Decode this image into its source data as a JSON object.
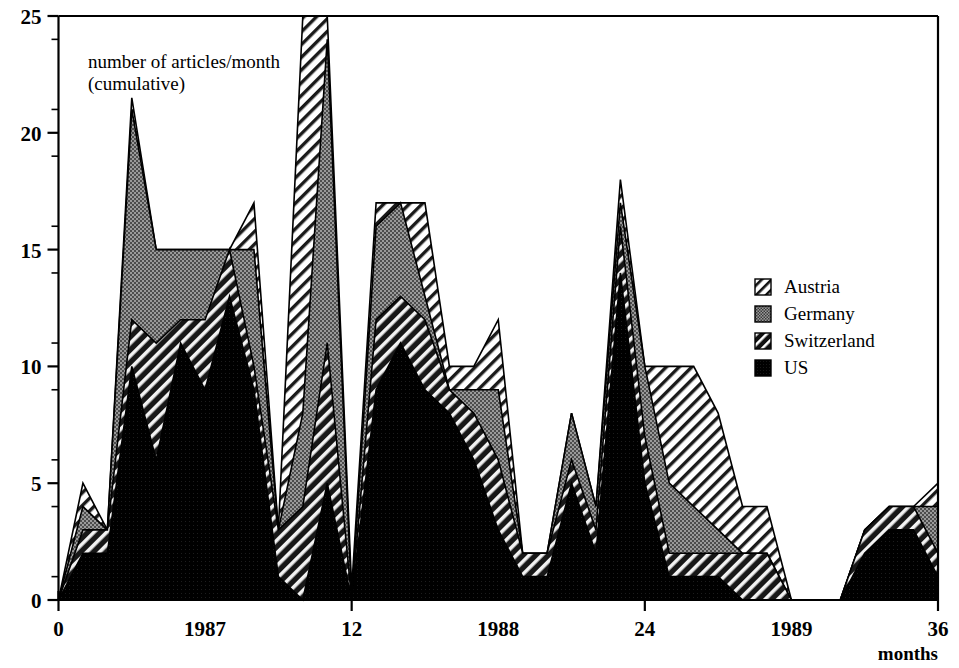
{
  "chart_data": {
    "type": "area",
    "title": "",
    "annotation": "number of articles/month\n(cumulative)",
    "annotation_line1": "number of articles/month",
    "annotation_line2": "(cumulative)",
    "xlabel": "months",
    "ylabel": "",
    "stacked": true,
    "grid": false,
    "legend_position": "right",
    "xlim": [
      0,
      36
    ],
    "ylim": [
      0,
      25
    ],
    "x_major_ticks": [
      0,
      12,
      24,
      36
    ],
    "x_major_tick_labels": [
      "0",
      "12",
      "24",
      "36"
    ],
    "x_year_labels": [
      {
        "x": 6,
        "label": "1987"
      },
      {
        "x": 18,
        "label": "1988"
      },
      {
        "x": 30,
        "label": "1989"
      }
    ],
    "y_major_ticks": [
      0,
      5,
      10,
      15,
      20,
      25
    ],
    "y_major_tick_labels": [
      "0",
      "5",
      "10",
      "15",
      "20",
      "25"
    ],
    "y_minor_ticks": [
      1,
      2,
      3,
      4,
      6,
      7,
      8,
      9,
      11,
      12,
      13,
      14,
      16,
      17,
      18,
      19,
      21,
      22,
      23,
      24
    ],
    "x": [
      0,
      1,
      2,
      3,
      4,
      5,
      6,
      7,
      8,
      9,
      10,
      11,
      12,
      13,
      14,
      15,
      16,
      17,
      18,
      19,
      20,
      21,
      22,
      23,
      24,
      25,
      26,
      27,
      28,
      29,
      30,
      31,
      32,
      33,
      34,
      35,
      36
    ],
    "series": [
      {
        "name": "US",
        "pattern": "solid-black",
        "color": "#000000",
        "values": [
          0,
          2,
          2,
          10,
          6,
          11,
          9,
          13,
          9,
          1,
          0,
          5,
          0,
          9,
          11,
          9,
          8,
          6,
          3,
          1,
          1,
          5,
          2,
          14,
          5,
          1,
          1,
          1,
          0,
          0,
          0,
          0,
          0,
          2,
          3,
          3,
          1
        ]
      },
      {
        "name": "Switzerland",
        "pattern": "diagonal-hatch-dark",
        "color": "#2a2a2a",
        "values": [
          0,
          1,
          1,
          2,
          5,
          1,
          3,
          2,
          1,
          2,
          4,
          6,
          0,
          3,
          2,
          3,
          1,
          2,
          3,
          1,
          1,
          1,
          1,
          2,
          2,
          1,
          1,
          1,
          2,
          2,
          0,
          0,
          0,
          1,
          1,
          1,
          1
        ]
      },
      {
        "name": "Germany",
        "pattern": "stipple-gray",
        "color": "#8a8a8a",
        "values": [
          0,
          1,
          0,
          9,
          4,
          3,
          3,
          0,
          5,
          0,
          4,
          13,
          0,
          4,
          4,
          1,
          0,
          1,
          3,
          0,
          0,
          2,
          1,
          1,
          3,
          3,
          2,
          1,
          0,
          0,
          0,
          0,
          0,
          0,
          0,
          0,
          2
        ]
      },
      {
        "name": "Austria",
        "pattern": "diagonal-hatch-light",
        "color": "#ffffff",
        "values": [
          0,
          1,
          0,
          0.5,
          0,
          0,
          0,
          0,
          2,
          0,
          17,
          1,
          0.5,
          1,
          0,
          4,
          1,
          1,
          3,
          0,
          0,
          0,
          0,
          1,
          0,
          5,
          6,
          5,
          2,
          2,
          0,
          0,
          0,
          0,
          0,
          0,
          1
        ]
      }
    ],
    "legend": [
      {
        "label": "Austria",
        "pattern": "diagonal-hatch-light"
      },
      {
        "label": "Germany",
        "pattern": "stipple-gray"
      },
      {
        "label": "Switzerland",
        "pattern": "diagonal-hatch-dark"
      },
      {
        "label": "US",
        "pattern": "solid-black"
      }
    ]
  }
}
